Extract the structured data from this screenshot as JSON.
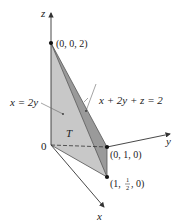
{
  "diagram": {
    "axes": {
      "x_label": "x",
      "y_label": "y",
      "z_label": "z",
      "origin_label": "0"
    },
    "points": [
      {
        "id": "p_z",
        "label": "(0, 0, 2)"
      },
      {
        "id": "p_y",
        "label": "(0, 1, 0)"
      },
      {
        "id": "p_xy",
        "label_prefix": "(1, ",
        "frac_num": "1",
        "frac_den": "2",
        "label_suffix": ", 0)"
      }
    ],
    "region_label": "T",
    "plane_labels": {
      "left_plane": "x = 2y",
      "slanted_plane": "x + 2y + z = 2"
    },
    "colors": {
      "front_face": "#c8c8c8",
      "side_face": "#9a9a9a",
      "bottom_face": "#d6d6d6",
      "axis": "#333333",
      "point": "#111111"
    }
  }
}
